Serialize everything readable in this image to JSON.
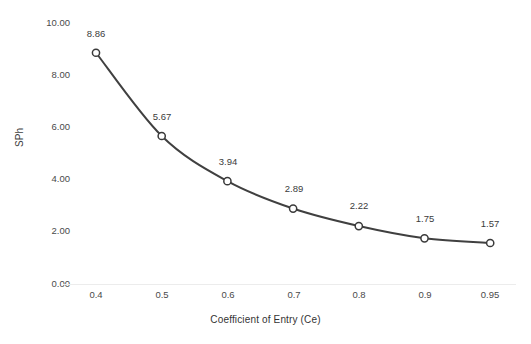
{
  "chart_data": {
    "type": "line",
    "title": "",
    "xlabel": "Coefficient of Entry (Ce)",
    "ylabel": "SPh",
    "categories": [
      "0.4",
      "0.5",
      "0.6",
      "0.7",
      "0.8",
      "0.9",
      "0.95"
    ],
    "values": [
      8.86,
      5.67,
      3.94,
      2.89,
      2.22,
      1.75,
      1.57
    ],
    "data_labels": [
      "8.86",
      "5.67",
      "3.94",
      "2.89",
      "2.22",
      "1.75",
      "1.57"
    ],
    "ylim": [
      0,
      10
    ],
    "ytick_labels": [
      "10.00",
      "8.00",
      "6.00",
      "4.00",
      "2.00",
      "0.00"
    ],
    "ytick_values": [
      10,
      8,
      6,
      4,
      2,
      0
    ],
    "grid": false,
    "legend": false,
    "series": [
      {
        "name": "SPh",
        "values": [
          8.86,
          5.67,
          3.94,
          2.89,
          2.22,
          1.75,
          1.57
        ],
        "line_color": "#404040",
        "marker": "open-circle",
        "marker_fill": "#ffffff",
        "marker_edge_color": "#3a3a3a"
      }
    ],
    "colors": {
      "line": "#404040",
      "marker_fill": "#ffffff",
      "marker_edge": "#3a3a3a",
      "axis_line": "#e8e8e8",
      "text": "#404040",
      "background": "#ffffff"
    }
  }
}
